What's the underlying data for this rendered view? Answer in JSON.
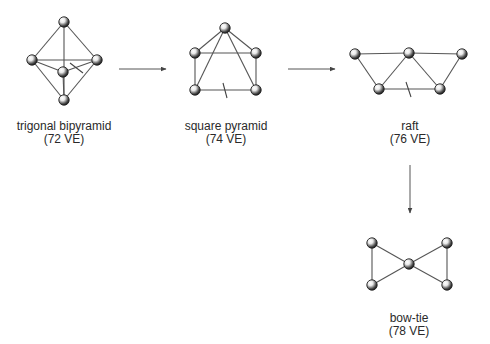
{
  "colors": {
    "edge": "#555555",
    "ball_dark": "#2a2a2a",
    "ball_light": "#ffffff",
    "text": "#2a2a2a"
  },
  "structures": [
    {
      "id": "trigonal-bipyramid",
      "name": "trigonal bipyramid",
      "ve": "(72 VE)",
      "label_pos": [
        64,
        120
      ],
      "atoms": [
        [
          64,
          22
        ],
        [
          32,
          60
        ],
        [
          97,
          60
        ],
        [
          63,
          72
        ],
        [
          64,
          100
        ]
      ],
      "edges": [
        [
          0,
          1
        ],
        [
          0,
          2
        ],
        [
          0,
          4
        ],
        [
          1,
          2
        ],
        [
          1,
          3
        ],
        [
          1,
          4
        ],
        [
          2,
          3
        ],
        [
          2,
          4
        ],
        [
          3,
          4
        ]
      ],
      "broken_marker": [
        [
          70,
          63
        ],
        [
          83,
          73
        ]
      ]
    },
    {
      "id": "square-pyramid",
      "name": "square pyramid",
      "ve": "(74 VE)",
      "label_pos": [
        226,
        120
      ],
      "atoms": [
        [
          225,
          28
        ],
        [
          195,
          53
        ],
        [
          256,
          53
        ],
        [
          195,
          90
        ],
        [
          256,
          90
        ]
      ],
      "edges": [
        [
          0,
          1
        ],
        [
          0,
          2
        ],
        [
          0,
          3
        ],
        [
          0,
          4
        ],
        [
          1,
          2
        ],
        [
          1,
          3
        ],
        [
          2,
          4
        ],
        [
          3,
          4
        ]
      ],
      "broken_marker": [
        [
          223,
          83
        ],
        [
          227,
          98
        ]
      ]
    },
    {
      "id": "raft",
      "name": "raft",
      "ve": "(76 VE)",
      "label_pos": [
        410,
        120
      ],
      "atoms": [
        [
          355,
          54
        ],
        [
          409,
          53
        ],
        [
          462,
          54
        ],
        [
          379,
          89
        ],
        [
          440,
          89
        ]
      ],
      "edges": [
        [
          0,
          1
        ],
        [
          1,
          2
        ],
        [
          0,
          3
        ],
        [
          1,
          3
        ],
        [
          1,
          4
        ],
        [
          2,
          4
        ],
        [
          3,
          4
        ]
      ],
      "broken_marker": [
        [
          406,
          82
        ],
        [
          411,
          97
        ]
      ]
    },
    {
      "id": "bow-tie",
      "name": "bow-tie",
      "ve": "(78 VE)",
      "label_pos": [
        409,
        312
      ],
      "atoms": [
        [
          372,
          243
        ],
        [
          372,
          285
        ],
        [
          409,
          264
        ],
        [
          447,
          243
        ],
        [
          447,
          285
        ]
      ],
      "edges": [
        [
          0,
          1
        ],
        [
          0,
          2
        ],
        [
          1,
          2
        ],
        [
          2,
          3
        ],
        [
          2,
          4
        ],
        [
          3,
          4
        ]
      ],
      "broken_marker": null
    }
  ],
  "arrows": [
    {
      "from": [
        119,
        69
      ],
      "to": [
        166,
        69
      ]
    },
    {
      "from": [
        288,
        69
      ],
      "to": [
        335,
        69
      ]
    },
    {
      "from": [
        410,
        165
      ],
      "to": [
        410,
        213
      ]
    }
  ]
}
